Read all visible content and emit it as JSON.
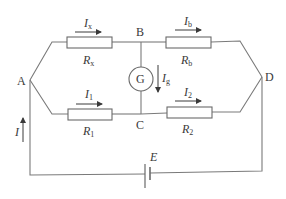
{
  "diagram": {
    "nodes": {
      "A": "A",
      "B": "B",
      "C": "C",
      "D": "D"
    },
    "resistors": {
      "rx": {
        "main": "R",
        "sub": "x"
      },
      "rb": {
        "main": "R",
        "sub": "b"
      },
      "r1": {
        "main": "R",
        "sub": "1"
      },
      "r2": {
        "main": "R",
        "sub": "2"
      }
    },
    "currents": {
      "ix": {
        "main": "I",
        "sub": "x"
      },
      "ib": {
        "main": "I",
        "sub": "b"
      },
      "i1": {
        "main": "I",
        "sub": "1"
      },
      "i2": {
        "main": "I",
        "sub": "2"
      },
      "ig": {
        "main": "I",
        "sub": "g"
      },
      "i": {
        "main": "I"
      }
    },
    "galvanometer": {
      "label": "G"
    },
    "battery": {
      "label": "E"
    },
    "colors": {
      "wire": "#7a7a7a",
      "text": "#3a3a3a"
    }
  }
}
